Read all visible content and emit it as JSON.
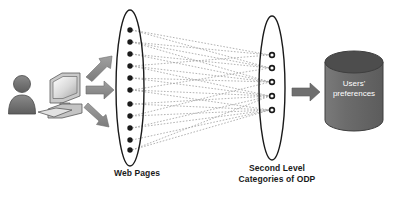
{
  "diagram": {
    "background_color": "#ffffff",
    "labels": {
      "web_pages": "Web Pages",
      "odp_line1": "Second Level",
      "odp_line2": "Categories of ODP"
    },
    "database": {
      "line1": "Users'",
      "line2": "preferences",
      "body_color": "#6e6e6e",
      "top_color": "#4f4f4f",
      "text_color": "#ffffff"
    },
    "actors": {
      "person_label": "user-person-icon",
      "computer_label": "desktop-computer-icon",
      "person_color": "#707070",
      "computer_color": "#b5b5b5"
    },
    "arrows": {
      "color": "#8a8a8a",
      "count": 3,
      "to_database_color": "#6b6b6b"
    },
    "left_ellipse": {
      "name": "web-pages-ellipse",
      "node_count": 11,
      "node_color": "#1a1a1a",
      "outline_color": "#1a1a1a",
      "cx": 130,
      "cy": 88,
      "rx": 14,
      "ry": 78
    },
    "right_ellipse": {
      "name": "odp-categories-ellipse",
      "node_count": 5,
      "node_color": "#1a1a1a",
      "outline_color": "#1a1a1a",
      "cx": 272,
      "cy": 88,
      "rx": 13,
      "ry": 72
    },
    "connections": {
      "style": "dotted",
      "color": "#9a9a9a",
      "description": "dotted lines fan from each web page node to second level ODP category nodes"
    }
  },
  "chart_data": {
    "type": "diagram",
    "nodes_left_y": [
      30,
      42,
      54,
      66,
      78,
      90,
      104,
      116,
      128,
      140,
      150
    ],
    "nodes_right_y": [
      55,
      68,
      82,
      96,
      110
    ],
    "mapping": [
      {
        "from": 0,
        "to": [
          0,
          1
        ]
      },
      {
        "from": 1,
        "to": [
          0,
          1,
          2
        ]
      },
      {
        "from": 2,
        "to": [
          1,
          2
        ]
      },
      {
        "from": 3,
        "to": [
          0,
          2,
          3
        ]
      },
      {
        "from": 4,
        "to": [
          2,
          3
        ]
      },
      {
        "from": 5,
        "to": [
          1,
          3,
          4
        ]
      },
      {
        "from": 6,
        "to": [
          3,
          4
        ]
      },
      {
        "from": 7,
        "to": [
          2,
          4
        ]
      },
      {
        "from": 8,
        "to": [
          3,
          4
        ]
      },
      {
        "from": 9,
        "to": [
          4
        ]
      },
      {
        "from": 10,
        "to": [
          3,
          4
        ]
      }
    ]
  }
}
